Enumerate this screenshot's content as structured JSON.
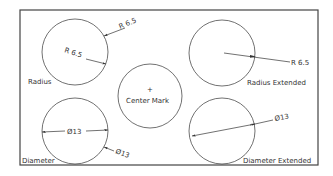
{
  "diagram": {
    "colors": {
      "line": "#333333",
      "border": "#444444",
      "background": "#ffffff"
    },
    "panels": [
      {
        "id": "radius",
        "label": "Radius",
        "dims": [
          "R 6.5",
          "R 6.5"
        ]
      },
      {
        "id": "radius-extended",
        "label": "Radius Extended",
        "dims": [
          "R 6.5"
        ]
      },
      {
        "id": "center-mark",
        "label": "Center Mark",
        "symbol": "+"
      },
      {
        "id": "diameter",
        "label": "Diameter",
        "dims": [
          "Ø13",
          "Ø13"
        ]
      },
      {
        "id": "diameter-extended",
        "label": "Diameter Extended",
        "dims": [
          "Ø13"
        ]
      }
    ]
  }
}
